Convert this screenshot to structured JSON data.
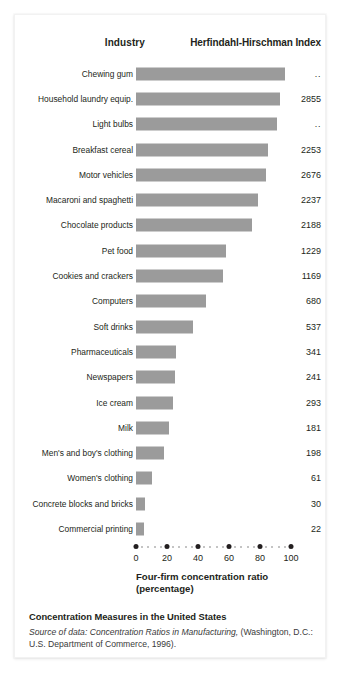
{
  "figure": {
    "columns": {
      "industry_header": "Industry",
      "hhi_header": "Herfindahl-Hirschman Index"
    },
    "axis": {
      "title_line1": "Four-firm concentration ratio",
      "title_line2": "(percentage)",
      "ticks": [
        "0",
        "20",
        "40",
        "60",
        "80",
        "100"
      ],
      "min": 0,
      "max": 100
    },
    "caption": {
      "title": "Concentration Measures in the United States",
      "source_italic": "Source of data: Concentration Ratios in Manufacturing,",
      "source_rest": " (Washington, D.C.: U.S. Department of Commerce, 1996)."
    },
    "colors": {
      "bar": "#9b9b9b",
      "text": "#231f20",
      "tick_major": "#231f20",
      "tick_minor": "#b0b0b0",
      "card_background": "#ffffff"
    }
  },
  "chart_data": {
    "type": "bar",
    "orientation": "horizontal",
    "title": "Concentration Measures in the United States",
    "xlabel": "Four-firm concentration ratio (percentage)",
    "ylabel": "Industry",
    "xlim": [
      0,
      100
    ],
    "xticks": [
      0,
      20,
      40,
      60,
      80,
      100
    ],
    "grid": false,
    "legend": "none",
    "categories": [
      "Chewing gum",
      "Household laundry equip.",
      "Light bulbs",
      "Breakfast cereal",
      "Motor vehicles",
      "Macaroni and spaghetti",
      "Chocolate products",
      "Pet food",
      "Cookies and crackers",
      "Computers",
      "Soft drinks",
      "Pharmaceuticals",
      "Newspapers",
      "Ice cream",
      "Milk",
      "Men's and boy's clothing",
      "Women's clothing",
      "Concrete blocks and bricks",
      "Commercial printing"
    ],
    "values": [
      96,
      93,
      91,
      85,
      84,
      79,
      75,
      58,
      56,
      45,
      37,
      26,
      25,
      24,
      21,
      18,
      10,
      6,
      5
    ],
    "value_labels": [
      "..",
      "2855",
      "..",
      "2253",
      "2676",
      "2237",
      "2188",
      "1229",
      "1169",
      "680",
      "537",
      "341",
      "241",
      "293",
      "181",
      "198",
      "61",
      "30",
      "22"
    ],
    "value_label_header": "Herfindahl-Hirschman Index"
  }
}
